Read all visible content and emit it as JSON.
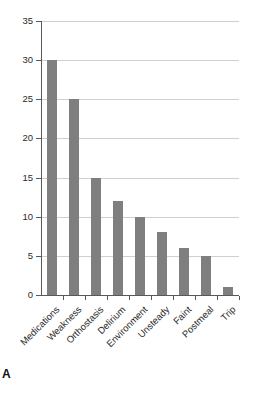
{
  "figure": {
    "panel_letter": "A",
    "bar_color": "#7f7f7f",
    "gridline_color": "#cfcfcf",
    "axis_color": "#58595b"
  },
  "chart_data": {
    "type": "bar",
    "title": "",
    "subtitle": "",
    "xlabel": "",
    "ylabel": "",
    "categories": [
      "Medications",
      "Weakness",
      "Orthostasis",
      "Delirium",
      "Environment",
      "Unsteady",
      "Faint",
      "Postmeal",
      "Trip"
    ],
    "values": [
      30,
      25,
      15,
      12,
      10,
      8,
      6,
      5,
      1
    ],
    "ylim": [
      0,
      35
    ],
    "yticks": [
      0,
      5,
      10,
      15,
      20,
      25,
      30,
      35
    ],
    "ytick_labels": [
      "0",
      "5",
      "10",
      "15",
      "20",
      "25",
      "30",
      "35"
    ],
    "grid": "horizontal",
    "legend": "none",
    "annotations": [
      "A"
    ]
  }
}
